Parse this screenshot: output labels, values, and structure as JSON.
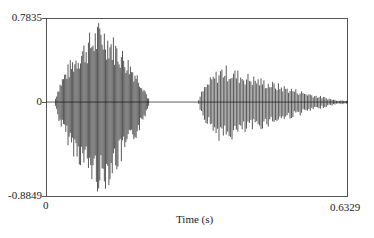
{
  "chart_data": {
    "type": "line",
    "title": "",
    "xlabel": "Time (s)",
    "ylabel": "",
    "xlim": [
      0,
      0.6329
    ],
    "ylim": [
      -0.8849,
      0.7835
    ],
    "x_tick_labels": [
      "0",
      "0.6329"
    ],
    "y_tick_labels": [
      "0.7835",
      "0",
      "-0.8849"
    ],
    "grid": false,
    "legend": null,
    "segments": [
      {
        "start": 0.02,
        "end": 0.215,
        "peak_pos": 0.7835,
        "peak_neg": -0.8849,
        "peak_time": 0.115
      },
      {
        "start": 0.32,
        "end": 0.6329,
        "peak_pos": 0.36,
        "peak_neg": -0.4,
        "peak_time": 0.37
      }
    ]
  },
  "axis": {
    "y_max_label": "0.7835",
    "y_zero_label": "0",
    "y_min_label": "-0.8849",
    "x_min_label": "0",
    "x_max_label": "0.6329",
    "x_title": "Time (s)"
  },
  "colors": {
    "wave": "#111111",
    "frame": "#555555"
  }
}
